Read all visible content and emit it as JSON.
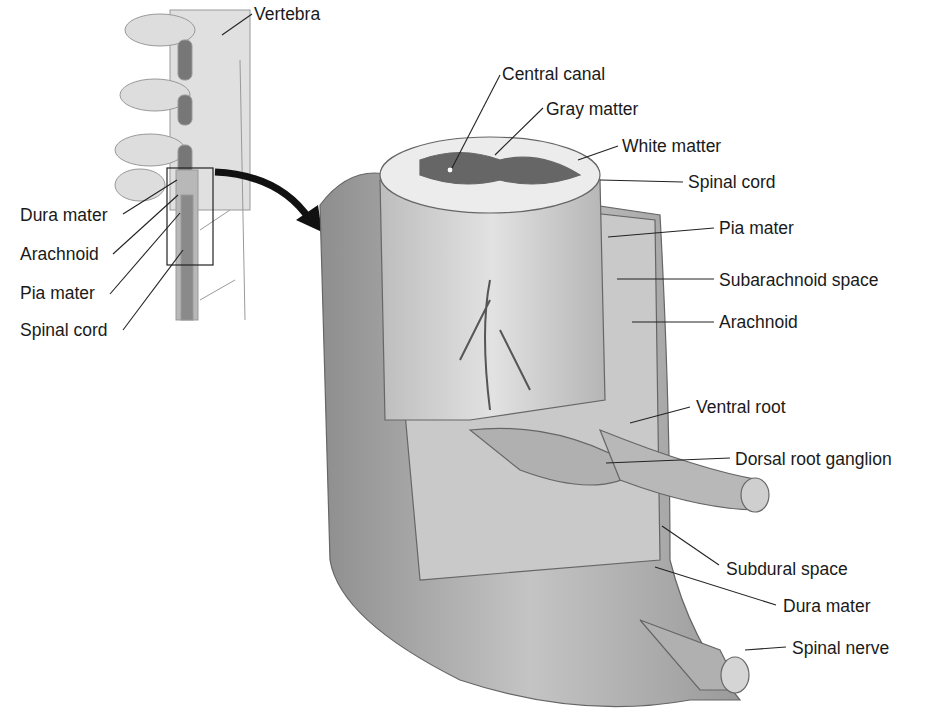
{
  "figure": {
    "inset_labels": [
      {
        "text": "Vertebra",
        "x": 254,
        "y": 6
      },
      {
        "text": "Dura mater",
        "x": 20,
        "y": 207
      },
      {
        "text": "Arachnoid",
        "x": 20,
        "y": 246
      },
      {
        "text": "Pia mater",
        "x": 20,
        "y": 285
      },
      {
        "text": "Spinal cord",
        "x": 20,
        "y": 322
      }
    ],
    "main_labels": [
      {
        "text": "Central canal",
        "x": 502,
        "y": 66
      },
      {
        "text": "Gray matter",
        "x": 546,
        "y": 101
      },
      {
        "text": "White matter",
        "x": 622,
        "y": 138
      },
      {
        "text": "Spinal cord",
        "x": 688,
        "y": 174
      },
      {
        "text": "Pia mater",
        "x": 719,
        "y": 220
      },
      {
        "text": "Subarachnoid space",
        "x": 719,
        "y": 272
      },
      {
        "text": "Arachnoid",
        "x": 719,
        "y": 314
      },
      {
        "text": "Ventral root",
        "x": 696,
        "y": 399
      },
      {
        "text": "Dorsal root ganglion",
        "x": 735,
        "y": 451
      },
      {
        "text": "Subdural space",
        "x": 726,
        "y": 561
      },
      {
        "text": "Dura mater",
        "x": 783,
        "y": 598
      },
      {
        "text": "Spinal nerve",
        "x": 792,
        "y": 640
      }
    ]
  }
}
